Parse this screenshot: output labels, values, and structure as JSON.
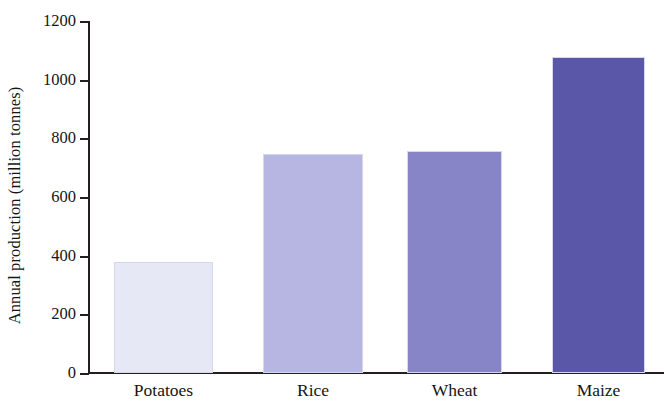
{
  "chart_data": {
    "type": "bar",
    "title": "",
    "subtitle": "",
    "xlabel": "",
    "ylabel": "Annual production (million tonnes)",
    "categories": [
      "Potatoes",
      "Rice",
      "Wheat",
      "Maize"
    ],
    "values": [
      380,
      748,
      758,
      1077
    ],
    "ylim": [
      0,
      1200
    ],
    "yticks": [
      0,
      200,
      400,
      600,
      800,
      1000,
      1200
    ],
    "ytick_labels": [
      "0",
      "200",
      "400",
      "600",
      "800",
      "1000",
      "1200"
    ],
    "grid": false,
    "legend": false,
    "legend_position": "none",
    "bar_colors": [
      "#e6e8f6",
      "#b7b5e1",
      "#8784c8",
      "#5b57a8"
    ],
    "bar_edge_color": "#d7d6ec",
    "axis_color": "#231f20",
    "background_color": "#ffffff"
  }
}
